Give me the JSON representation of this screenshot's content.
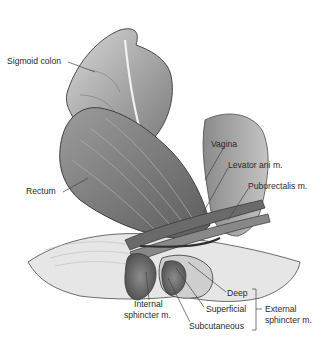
{
  "diagram": {
    "type": "anatomical illustration (grayscale)"
  },
  "labels": {
    "sigmoid_colon": "Sigmoid colon",
    "rectum": "Rectum",
    "vagina": "Vagina",
    "levator_ani": "Levator ani m.",
    "puborectalis": "Puborectalis m.",
    "deep": "Deep",
    "superficial": "Superficial",
    "subcutaneous": "Subcutaneous",
    "internal_sphincter_1": "Internal",
    "internal_sphincter_2": "sphincter m.",
    "external_sphincter_1": "External",
    "external_sphincter_2": "sphincter m."
  },
  "colors": {
    "background": "#ffffff",
    "tissue_light": "#c8c8c8",
    "tissue_mid": "#9a9a9a",
    "tissue_dark": "#5a5a5a",
    "outline": "#3a3a3a",
    "leader_line": "#444444"
  }
}
